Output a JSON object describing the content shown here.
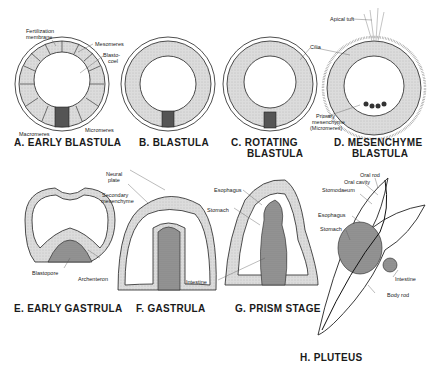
{
  "figure": {
    "panels": [
      {
        "id": "A",
        "title": "A. EARLY BLASTULA",
        "labels": [
          "Fertilization membrane",
          "Mesomeres",
          "Blasto- coel",
          "Macromeres",
          "Micromeres"
        ]
      },
      {
        "id": "B",
        "title": "B. BLASTULA",
        "labels": []
      },
      {
        "id": "C",
        "title_line1": "C. ROTATING",
        "title_line2": "BLASTULA",
        "labels": [
          "Cilia"
        ]
      },
      {
        "id": "D",
        "title_line1": "D. MESENCHYME",
        "title_line2": "BLASTULA",
        "labels": [
          "Apical tuft",
          "Primary mesenchyme (Micromeres)"
        ]
      },
      {
        "id": "E",
        "title": "E. EARLY GASTRULA",
        "labels": [
          "Blastopore",
          "Archenteron"
        ]
      },
      {
        "id": "F",
        "title": "F. GASTRULA",
        "labels": [
          "Neural plate",
          "Secondary mesenchyme",
          "Intestine"
        ]
      },
      {
        "id": "G",
        "title": "G. PRISM STAGE",
        "labels": [
          "Esophagus",
          "Stomach"
        ]
      },
      {
        "id": "H",
        "title": "H. PLUTEUS",
        "labels": [
          "Oral rod",
          "Oral cavity",
          "Stomodaeum",
          "Esophagus",
          "Stomach",
          "Intestine",
          "Body rod"
        ]
      }
    ],
    "labels": {
      "fert1": "Fertilization",
      "fert2": "membrane",
      "mesomeres": "Mesomeres",
      "blasto1": "Blasto-",
      "blasto2": "coel",
      "macromeres": "Macromeres",
      "micromeres": "Micromeres",
      "cilia": "Cilia",
      "apical_tuft": "Apical tuft",
      "primary1": "Primary",
      "primary2": "mesenchyme",
      "primary3": "(Micromeres)",
      "neural1": "Neural",
      "neural2": "plate",
      "secondary1": "Secondary",
      "secondary2": "mesenchyme",
      "blastopore": "Blastopore",
      "archenteron": "Archenteron",
      "intestine_f": "Intestine",
      "esophagus_g": "Esophagus",
      "stomach_g": "Stomach",
      "oral_rod": "Oral rod",
      "oral_cavity": "Oral cavity",
      "stomodaeum": "Stomodaeum",
      "esophagus_h": "Esophagus",
      "stomach_h": "Stomach",
      "intestine_h": "Intestine",
      "body_rod": "Body rod"
    },
    "titles": {
      "a": "A. EARLY BLASTULA",
      "b": "B. BLASTULA",
      "c1": "C. ROTATING",
      "c2": "BLASTULA",
      "d1": "D. MESENCHYME",
      "d2": "BLASTULA",
      "e": "E. EARLY GASTRULA",
      "f": "F. GASTRULA",
      "g": "G. PRISM STAGE",
      "h": "H. PLUTEUS"
    },
    "colors": {
      "ink": "#1a1a1a",
      "cell_fill": "#d9d9d9",
      "stipple_dark": "#8a8a8a",
      "background": "#ffffff"
    }
  }
}
